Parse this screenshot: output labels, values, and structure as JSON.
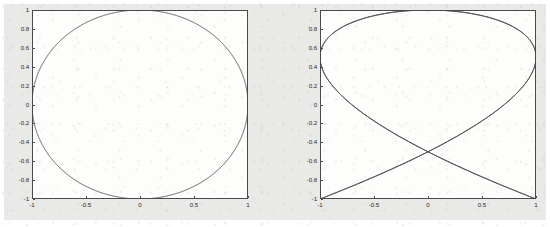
{
  "figure": {
    "background_color": "#e9e9e7",
    "axes_background_color": "#fdfdfc",
    "line_color": "#4a4a4a",
    "axis_color": "#4a4a4a",
    "tick_text_color": "#2b2b2b"
  },
  "chart_data": [
    {
      "type": "line",
      "name": "left-plot",
      "title": "",
      "xlabel": "",
      "ylabel": "",
      "xlim": [
        -1,
        1
      ],
      "ylim": [
        -1,
        1
      ],
      "grid": false,
      "legend": null,
      "xticks": [
        -1,
        -0.5,
        0,
        0.5,
        1
      ],
      "xtick_labels": [
        "-1",
        "-0.5",
        "0",
        "0.5",
        "1"
      ],
      "yticks": [
        -1,
        -0.8,
        -0.6,
        -0.4,
        -0.2,
        0,
        0.2,
        0.4,
        0.6,
        0.8,
        1
      ],
      "ytick_labels": [
        "-1",
        "-0.8",
        "-0.6",
        "-0.4",
        "-0.2",
        "0",
        "0.2",
        "0.4",
        "0.6",
        "0.8",
        "1"
      ],
      "curve": {
        "description": "Lissajous 1:1 (circle)",
        "x_formula": "sin(t)",
        "y_formula": "cos(t)",
        "freq_x": 1,
        "freq_y": 1,
        "phase": 0,
        "t_range": [
          0,
          6.283185307179586
        ]
      }
    },
    {
      "type": "line",
      "name": "right-plot",
      "title": "",
      "xlabel": "",
      "ylabel": "",
      "xlim": [
        -1,
        1
      ],
      "ylim": [
        -1,
        1
      ],
      "grid": false,
      "legend": null,
      "xticks": [
        -1,
        -0.5,
        0,
        0.5,
        1
      ],
      "xtick_labels": [
        "-1",
        "-0.5",
        "0",
        "0.5",
        "1"
      ],
      "yticks": [
        -1,
        -0.8,
        -0.6,
        -0.4,
        -0.2,
        0,
        0.2,
        0.4,
        0.6,
        0.8,
        1
      ],
      "ytick_labels": [
        "-1",
        "-0.8",
        "-0.6",
        "-0.4",
        "-0.2",
        "0",
        "0.2",
        "0.4",
        "0.6",
        "0.8",
        "1"
      ],
      "curve": {
        "description": "Lissajous 3:2",
        "x_formula": "sin(3t)",
        "y_formula": "cos(2t)",
        "freq_x": 3,
        "freq_y": 2,
        "phase": 0,
        "t_range": [
          0,
          6.283185307179586
        ]
      }
    }
  ]
}
